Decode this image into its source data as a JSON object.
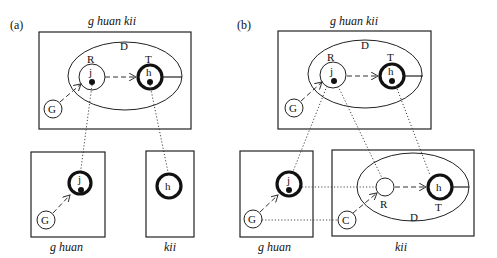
{
  "panels": {
    "a": {
      "label": "(a)",
      "top_box_title": "g huan kii",
      "region_label": "D",
      "node_r_label": "R",
      "node_t_label": "T",
      "node_j": "j",
      "node_h": "h",
      "node_g": "G",
      "bottom_left_title": "g huan",
      "bottom_left_node_j": "j",
      "bottom_left_node_g": "G",
      "bottom_right_title": "kii",
      "bottom_right_node_h": "h"
    },
    "b": {
      "label": "(b)",
      "top_box_title": "g huan kii",
      "region_label": "D",
      "node_r_label": "R",
      "node_t_label": "T",
      "node_j": "j",
      "node_h": "h",
      "node_g": "G",
      "bottom_left_title": "g huan",
      "bottom_left_node_j": "j",
      "bottom_left_node_g": "G",
      "bottom_right_title": "kii",
      "bottom_right_region_label": "D",
      "bottom_right_node_r_label": "R",
      "bottom_right_node_t_label": "T",
      "bottom_right_node_h": "h",
      "bottom_right_node_c": "C"
    }
  }
}
